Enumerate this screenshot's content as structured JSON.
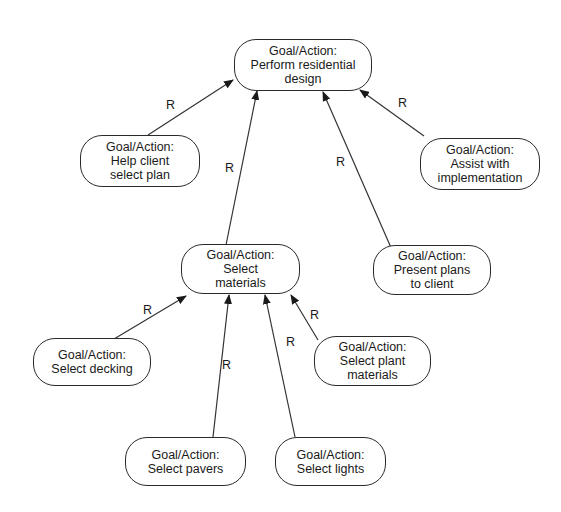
{
  "diagram": {
    "nodes": [
      {
        "id": "perform",
        "title": "Goal/Action:",
        "line1": "Perform residential",
        "line2": "design"
      },
      {
        "id": "help",
        "title": "Goal/Action:",
        "line1": "Help client",
        "line2": "select plan"
      },
      {
        "id": "assist",
        "title": "Goal/Action:",
        "line1": "Assist with",
        "line2": "implementation"
      },
      {
        "id": "materials",
        "title": "Goal/Action:",
        "line1": "Select",
        "line2": "materials"
      },
      {
        "id": "present",
        "title": "Goal/Action:",
        "line1": "Present plans",
        "line2": "to client"
      },
      {
        "id": "decking",
        "title": "Goal/Action:",
        "line1": "Select decking",
        "line2": ""
      },
      {
        "id": "plant",
        "title": "Goal/Action:",
        "line1": "Select plant",
        "line2": "materials"
      },
      {
        "id": "pavers",
        "title": "Goal/Action:",
        "line1": "Select pavers",
        "line2": ""
      },
      {
        "id": "lights",
        "title": "Goal/Action:",
        "line1": "Select lights",
        "line2": ""
      }
    ],
    "edges": [
      {
        "from": "help",
        "to": "perform",
        "label": "R"
      },
      {
        "from": "materials",
        "to": "perform",
        "label": "R"
      },
      {
        "from": "present",
        "to": "perform",
        "label": "R"
      },
      {
        "from": "assist",
        "to": "perform",
        "label": "R"
      },
      {
        "from": "decking",
        "to": "materials",
        "label": "R"
      },
      {
        "from": "pavers",
        "to": "materials",
        "label": "R"
      },
      {
        "from": "lights",
        "to": "materials",
        "label": "R"
      },
      {
        "from": "plant",
        "to": "materials",
        "label": "R"
      }
    ]
  }
}
